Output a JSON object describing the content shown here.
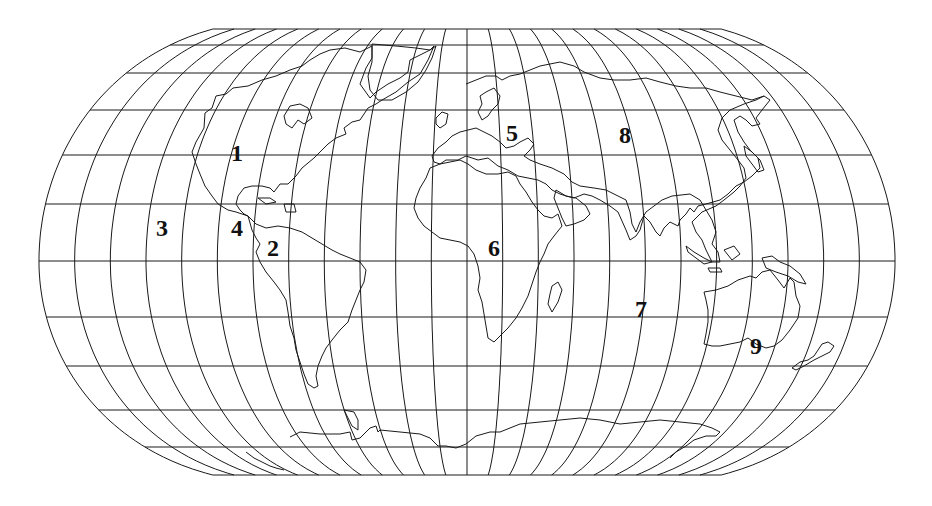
{
  "map": {
    "title": "",
    "projection": "pseudo-cylindrical world projection with graticule",
    "line_color": "#1a1a1a",
    "background": "#ffffff",
    "frame": {
      "center_x": 467,
      "equator_y": 261,
      "top_y": 29,
      "bottom_y": 475,
      "half_width_equator": 428,
      "half_width_pole": 172
    },
    "parallels_y": [
      29,
      45,
      73,
      110,
      155,
      204,
      261,
      317,
      366,
      410,
      447,
      475
    ],
    "meridian_count_each_side": 12,
    "region_labels": [
      {
        "id": "1",
        "text": "1",
        "x": 237,
        "y": 161
      },
      {
        "id": "2",
        "text": "2",
        "x": 273,
        "y": 256
      },
      {
        "id": "3",
        "text": "3",
        "x": 162,
        "y": 236
      },
      {
        "id": "4",
        "text": "4",
        "x": 237,
        "y": 236
      },
      {
        "id": "5",
        "text": "5",
        "x": 512,
        "y": 141
      },
      {
        "id": "6",
        "text": "6",
        "x": 494,
        "y": 256
      },
      {
        "id": "7",
        "text": "7",
        "x": 641,
        "y": 317
      },
      {
        "id": "8",
        "text": "8",
        "x": 625,
        "y": 143
      },
      {
        "id": "9",
        "text": "9",
        "x": 756,
        "y": 354
      }
    ]
  }
}
